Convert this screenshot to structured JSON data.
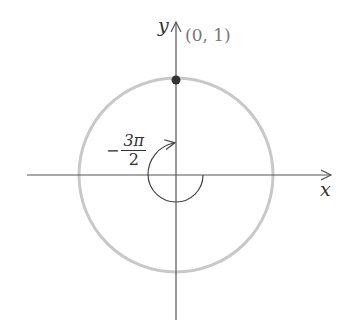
{
  "diagram": {
    "type": "unit-circle",
    "axes": {
      "x_label": "x",
      "y_label": "y"
    },
    "point": {
      "label": "(0, 1)",
      "coords": [
        0,
        1
      ]
    },
    "angle": {
      "sign": "−",
      "numerator": "3π",
      "denominator": "2",
      "direction": "clockwise"
    },
    "colors": {
      "axis": "#555555",
      "circle": "#c8c8c8",
      "point": "#333333",
      "point_label": "#777777",
      "arc": "#444444"
    }
  }
}
